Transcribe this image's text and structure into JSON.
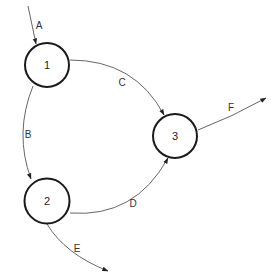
{
  "diagram": {
    "type": "directed-graph",
    "nodes": [
      {
        "id": "1",
        "label": "1"
      },
      {
        "id": "2",
        "label": "2"
      },
      {
        "id": "3",
        "label": "3"
      }
    ],
    "edges": [
      {
        "id": "A",
        "label": "A",
        "from": null,
        "to": "1"
      },
      {
        "id": "B",
        "label": "B",
        "from": "1",
        "to": "2"
      },
      {
        "id": "C",
        "label": "C",
        "from": "1",
        "to": "3"
      },
      {
        "id": "D",
        "label": "D",
        "from": "2",
        "to": "3"
      },
      {
        "id": "E",
        "label": "E",
        "from": "2",
        "to": null
      },
      {
        "id": "F",
        "label": "F",
        "from": "3",
        "to": null
      }
    ],
    "colors": {
      "node_stroke": "#1a1a1a",
      "edge_stroke": "#555555",
      "background": "#ffffff"
    }
  }
}
